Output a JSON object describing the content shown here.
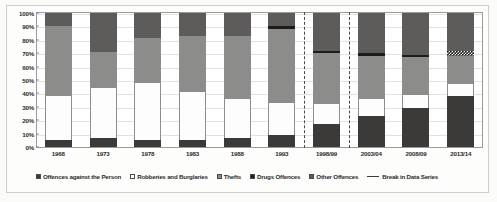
{
  "chart_data": {
    "type": "bar",
    "title": "",
    "subtitle": "",
    "xlabel": "",
    "ylabel": "",
    "stacked": true,
    "stack_mode": "percent",
    "grid": true,
    "legend_position": "bottom",
    "ylim": [
      0,
      100
    ],
    "ytick_labels": [
      "0%",
      "10%",
      "20%",
      "30%",
      "40%",
      "50%",
      "60%",
      "70%",
      "80%",
      "90%",
      "100%"
    ],
    "ytick_values": [
      0,
      10,
      20,
      30,
      40,
      50,
      60,
      70,
      80,
      90,
      100
    ],
    "categories": [
      "1968",
      "1973",
      "1978",
      "1983",
      "1988",
      "1993",
      "1998/99",
      "2003/04",
      "2008/09",
      "2013/14"
    ],
    "series": [
      {
        "name": "Offences against the Person",
        "color": "#3b3a38",
        "values": [
          5,
          7,
          5,
          5,
          7,
          9,
          17,
          23,
          29,
          38
        ]
      },
      {
        "name": "Robberies and Burglaries",
        "color": "#ffffff",
        "values": [
          33,
          37,
          43,
          36,
          29,
          24,
          15,
          13,
          10,
          9
        ]
      },
      {
        "name": "Thefts",
        "color": "#8c8c8a",
        "values": [
          52,
          27,
          33,
          42,
          47,
          55,
          38,
          32,
          28,
          21
        ]
      },
      {
        "name": "Drugs Offences",
        "color": "#1d1c1b",
        "values": [
          0,
          0,
          0,
          0,
          0,
          2,
          2,
          2,
          2,
          4
        ]
      },
      {
        "name": "Other Offences",
        "color": "#5d5c5a",
        "values": [
          10,
          29,
          19,
          17,
          17,
          10,
          28,
          30,
          31,
          28
        ]
      }
    ],
    "break_in_data_series": {
      "label": "Break in Data Series",
      "after_categories": [
        "1993",
        "1998/99"
      ]
    },
    "legend_entries": [
      "Offences against the Person",
      "Robberies and Burglaries",
      "Thefts",
      "Drugs Offences",
      "Other Offences",
      "Break in Data Series"
    ]
  }
}
